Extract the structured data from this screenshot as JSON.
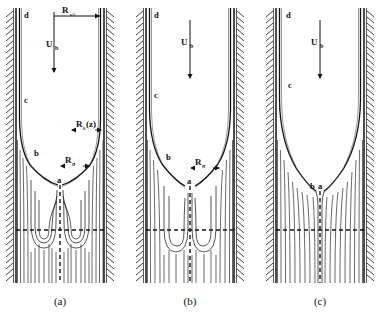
{
  "figure": {
    "type": "streamline-diagram",
    "panel_count": 3
  },
  "panels": [
    {
      "id": "a",
      "caption": "(a)",
      "node_labels": [
        "a",
        "b",
        "c",
        "d"
      ],
      "annotations": [
        "R_s∞",
        "U_b",
        "R_s(z)",
        "R_σ"
      ],
      "has_recirculation": true,
      "loop_pairs": 3,
      "neck_width_px": 6
    },
    {
      "id": "b",
      "caption": "(b)",
      "node_labels": [
        "a",
        "b",
        "c",
        "d"
      ],
      "annotations": [
        "U_b",
        "R_σ"
      ],
      "has_recirculation": true,
      "loop_pairs": 2,
      "neck_width_px": 10
    },
    {
      "id": "c",
      "caption": "(c)",
      "node_labels": [
        "a",
        "b",
        "c",
        "d"
      ],
      "annotations": [
        "U_b"
      ],
      "has_recirculation": false,
      "loop_pairs": 0,
      "neck_width_px": 14
    }
  ],
  "labels": {
    "R_s_infinity": {
      "base": "R",
      "sub": "s∞",
      "text": "Rₛ∞"
    },
    "U_b": {
      "base": "U",
      "sub": "b",
      "text": "Uᵇ"
    },
    "R_s_z": {
      "base": "R",
      "sub": "s",
      "suffix": "(z)",
      "text": "Rₛ(z)"
    },
    "R_sigma": {
      "base": "R",
      "sub": "σ",
      "text": "Rσ"
    },
    "node_a": "a",
    "node_b": "b",
    "node_c": "c",
    "node_d": "d"
  },
  "captions": {
    "a": "(a)",
    "b": "(b)",
    "c": "(c)"
  },
  "colors": {
    "line": "#111111",
    "wall": "#1a1a1a",
    "background": "#ffffff",
    "streamline": "#2a2a2a"
  }
}
